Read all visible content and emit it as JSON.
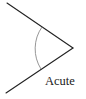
{
  "diagram": {
    "type": "angle",
    "label": "Acute",
    "vertex": [
      73,
      48
    ],
    "rays": [
      {
        "name": "upper-ray",
        "from": [
          73,
          48
        ],
        "to": [
          7,
          3
        ]
      },
      {
        "name": "lower-ray",
        "from": [
          73,
          48
        ],
        "to": [
          6,
          93
        ]
      }
    ],
    "arc": {
      "start": [
        42,
        27
      ],
      "end": [
        41,
        69
      ],
      "radius": 38
    },
    "colors": {
      "ray": "#222222",
      "arc": "#8a8a8a",
      "text": "#1a1a1a",
      "background": "#ffffff"
    }
  }
}
